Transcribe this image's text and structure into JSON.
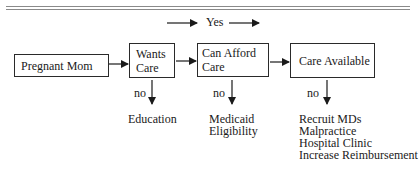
{
  "diagram": {
    "top_label": "Yes",
    "nodes": [
      {
        "id": "pregnant-mom",
        "label": "Pregnant Mom"
      },
      {
        "id": "wants-care",
        "label_line1": "Wants",
        "label_line2": "Care"
      },
      {
        "id": "can-afford-care",
        "label_line1": "Can Afford",
        "label_line2": "Care"
      },
      {
        "id": "care-available",
        "label": "Care Available"
      }
    ],
    "branch_label": "no",
    "outcomes": {
      "wants_care": [
        "Education"
      ],
      "can_afford_care": [
        "Medicaid",
        "Eligibility"
      ],
      "care_available": [
        "Recruit MDs",
        "Malpractice",
        "Hospital Clinic",
        "Increase Reimbursement"
      ]
    },
    "colors": {
      "line": "#1a1a1a",
      "rule": "#8a8a8a",
      "background": "#ffffff"
    }
  }
}
